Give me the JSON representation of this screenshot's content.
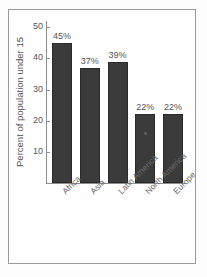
{
  "chart_data": {
    "type": "bar",
    "title": "",
    "xlabel": "",
    "ylabel": "Percent of population under 15",
    "categories": [
      "Africa",
      "Asia",
      "Latin America",
      "North America",
      "Europe"
    ],
    "values": [
      45,
      37,
      39,
      22,
      22
    ],
    "data_labels": [
      "45%",
      "37%",
      "39%",
      "22%",
      "22%"
    ],
    "ylim": [
      0,
      52
    ],
    "yticks": [
      10,
      20,
      30,
      40,
      50
    ],
    "ytick_labels": [
      "10",
      "20",
      "30",
      "40",
      "50"
    ],
    "grid": false,
    "legend": null,
    "bar_color": "#3b3b3b",
    "axis_color": "#8d8d8d",
    "frame_color": "#9a9a9a",
    "background_color": "#fefefe"
  }
}
